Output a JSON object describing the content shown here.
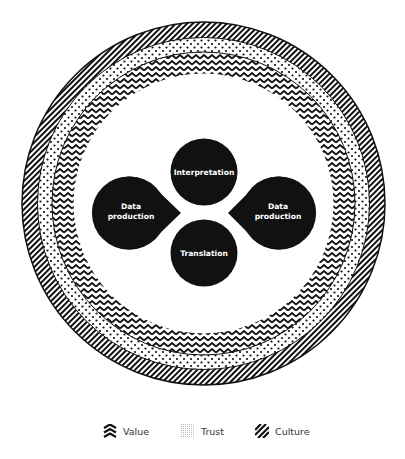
{
  "diagram": {
    "nodes": [
      {
        "id": "interpretation",
        "label": "Interpretation",
        "shape": "circle"
      },
      {
        "id": "data-production-left",
        "label_line1": "Data",
        "label_line2": "production",
        "shape": "teardrop-right"
      },
      {
        "id": "data-production-right",
        "label_line1": "Data",
        "label_line2": "production",
        "shape": "teardrop-left"
      },
      {
        "id": "translation",
        "label": "Translation",
        "shape": "circle"
      }
    ],
    "rings": [
      {
        "name": "Culture",
        "pattern": "diagonal-stripes",
        "position": "outer"
      },
      {
        "name": "Trust",
        "pattern": "dots",
        "position": "middle"
      },
      {
        "name": "Value",
        "pattern": "chevron",
        "position": "inner"
      }
    ],
    "colors": {
      "node_fill": "#111111",
      "node_text": "#ffffff",
      "pattern": "#111111",
      "background": "#ffffff"
    }
  },
  "legend": {
    "items": [
      {
        "label": "Value",
        "icon": "chevron-pattern-icon"
      },
      {
        "label": "Trust",
        "icon": "dots-pattern-icon"
      },
      {
        "label": "Culture",
        "icon": "stripes-pattern-icon"
      }
    ]
  }
}
